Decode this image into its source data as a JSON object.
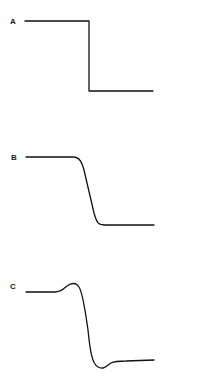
{
  "panels": [
    {
      "label": "A",
      "shape": "ideal-step-down"
    },
    {
      "label": "B",
      "shape": "smooth-step-down"
    },
    {
      "label": "C",
      "shape": "step-down-with-overshoot-and-undershoot"
    }
  ],
  "colors": {
    "line": "#111111",
    "background": "#ffffff"
  }
}
